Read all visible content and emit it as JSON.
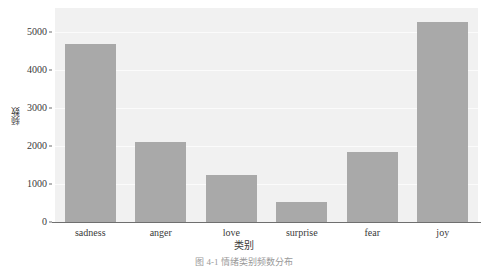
{
  "figure": {
    "caption": "图 4-1   情绪类别频数分布",
    "panel_bg": "#f1f1f1",
    "gridline_color": "#fbfbfb",
    "bar_color": "#a9a9a9",
    "axis_color": "#6f6f6f",
    "text_color": "#3a3a3a"
  },
  "chart_data": {
    "type": "bar",
    "title": "",
    "xlabel": "类别",
    "ylabel": "频数",
    "categories": [
      "sadness",
      "anger",
      "love",
      "surprise",
      "fear",
      "joy"
    ],
    "values": [
      4680,
      2110,
      1240,
      530,
      1850,
      5280
    ],
    "ylim": [
      0,
      5640
    ],
    "yticks": [
      0,
      1000,
      2000,
      3000,
      4000,
      5000
    ],
    "ytick_labels": [
      "0",
      "1000",
      "2000",
      "3000",
      "4000",
      "5000"
    ],
    "grid": true,
    "grid_axis": "y",
    "legend": false,
    "orientation": "vertical"
  }
}
